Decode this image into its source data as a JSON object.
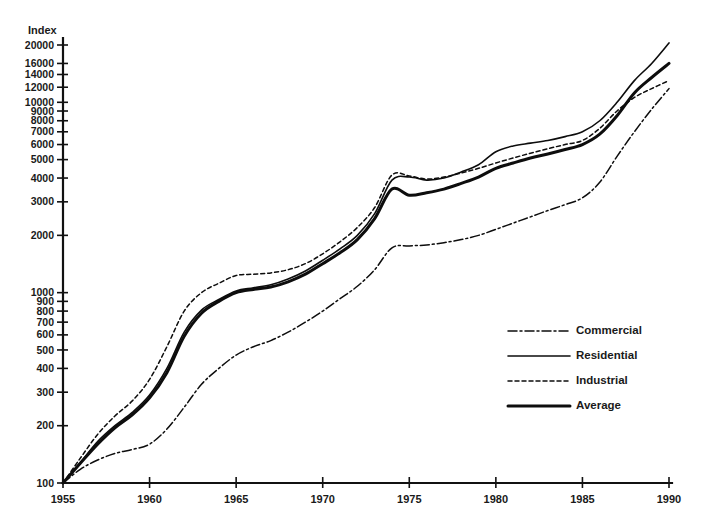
{
  "chart_data": {
    "type": "line",
    "title": "",
    "subtitle": "",
    "ylabel": "Index",
    "xlabel": "",
    "yscale": "log",
    "ylim": [
      100,
      22000
    ],
    "xlim": [
      1955,
      1990
    ],
    "grid": false,
    "legend_position": "right-middle",
    "ytick_labels": [
      "20000",
      "16000",
      "14000",
      "12000",
      "10000",
      "9000",
      "8000",
      "7000",
      "6000",
      "5000",
      "4000",
      "3000",
      "2000",
      "1000",
      "900",
      "800",
      "700",
      "600",
      "500",
      "400",
      "300",
      "200",
      "100"
    ],
    "ytick_values": [
      20000,
      16000,
      14000,
      12000,
      10000,
      9000,
      8000,
      7000,
      6000,
      5000,
      4000,
      3000,
      2000,
      1000,
      900,
      800,
      700,
      600,
      500,
      400,
      300,
      200,
      100
    ],
    "xtick_labels": [
      "1955",
      "1960",
      "1965",
      "1970",
      "1975",
      "1980",
      "1985",
      "1990"
    ],
    "xtick_values": [
      1955,
      1960,
      1965,
      1970,
      1975,
      1980,
      1985,
      1990
    ],
    "x": [
      1955,
      1956,
      1957,
      1958,
      1959,
      1960,
      1961,
      1962,
      1963,
      1964,
      1965,
      1966,
      1967,
      1968,
      1969,
      1970,
      1971,
      1972,
      1973,
      1974,
      1975,
      1976,
      1977,
      1978,
      1979,
      1980,
      1981,
      1982,
      1983,
      1984,
      1985,
      1986,
      1987,
      1988,
      1989,
      1990
    ],
    "series": [
      {
        "name": "Commercial",
        "style": "dash-dot",
        "width": 1.5,
        "values": [
          100,
          118,
          132,
          143,
          150,
          160,
          192,
          250,
          330,
          400,
          470,
          520,
          560,
          620,
          700,
          800,
          930,
          1080,
          1320,
          1720,
          1760,
          1780,
          1830,
          1900,
          2000,
          2150,
          2320,
          2500,
          2700,
          2900,
          3150,
          3800,
          5200,
          7000,
          9200,
          11800
        ]
      },
      {
        "name": "Residential",
        "style": "solid-thin",
        "width": 1.6,
        "values": [
          100,
          128,
          165,
          200,
          235,
          290,
          400,
          620,
          810,
          920,
          1020,
          1060,
          1100,
          1180,
          1300,
          1480,
          1700,
          2000,
          2600,
          3900,
          4050,
          3900,
          4000,
          4300,
          4700,
          5500,
          5900,
          6100,
          6300,
          6600,
          7000,
          8000,
          10000,
          13000,
          16000,
          20500
        ]
      },
      {
        "name": "Industrial",
        "style": "dotted",
        "width": 1.5,
        "values": [
          100,
          135,
          180,
          225,
          270,
          350,
          520,
          800,
          1000,
          1120,
          1230,
          1250,
          1270,
          1320,
          1420,
          1600,
          1850,
          2200,
          2800,
          4150,
          4100,
          3950,
          4050,
          4250,
          4500,
          4800,
          5100,
          5400,
          5700,
          6000,
          6300,
          7300,
          9000,
          10600,
          11800,
          13000
        ]
      },
      {
        "name": "Average",
        "style": "solid-thick",
        "width": 3.0,
        "values": [
          100,
          127,
          160,
          195,
          228,
          280,
          380,
          590,
          780,
          900,
          1000,
          1040,
          1070,
          1140,
          1250,
          1420,
          1620,
          1900,
          2450,
          3500,
          3250,
          3350,
          3500,
          3750,
          4050,
          4500,
          4800,
          5100,
          5350,
          5650,
          6000,
          6800,
          8500,
          11200,
          13500,
          16000
        ]
      }
    ]
  },
  "legend": {
    "items": [
      {
        "label": "Commercial",
        "style": "dash-dot"
      },
      {
        "label": "Residential",
        "style": "solid-thin"
      },
      {
        "label": "Industrial",
        "style": "dotted"
      },
      {
        "label": "Average",
        "style": "solid-thick"
      }
    ]
  },
  "colors": {
    "ink": "#0d0d0d",
    "background": "#ffffff"
  }
}
